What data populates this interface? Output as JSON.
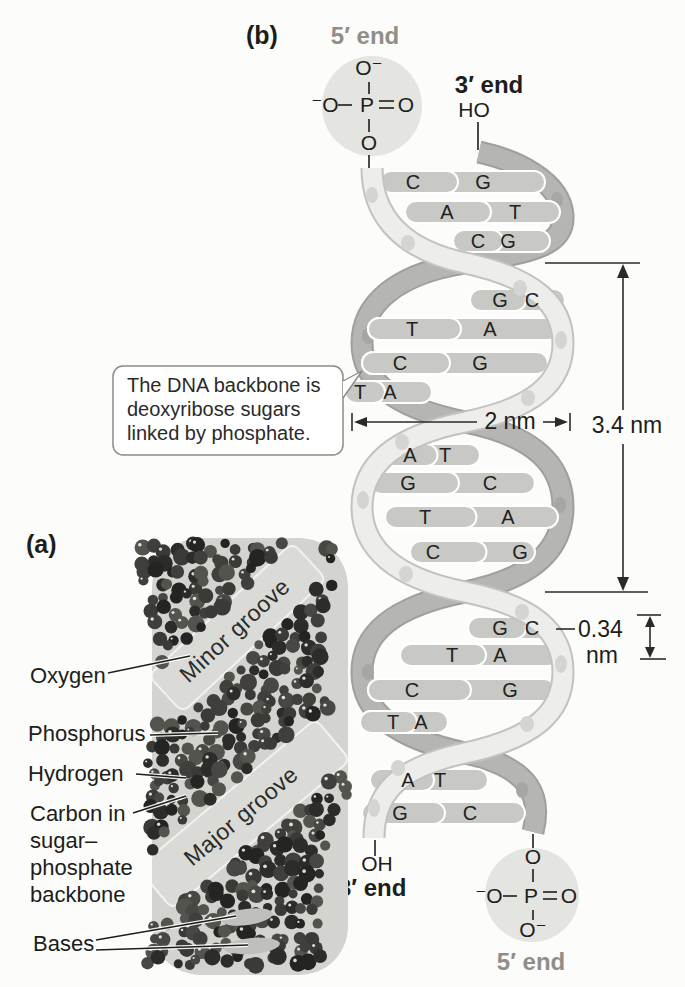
{
  "figure_labels": {
    "panel_a": "(a)",
    "panel_b": "(b)"
  },
  "strand_ends": {
    "top_five_prime": "5′ end",
    "top_three_prime": "3′ end",
    "top_ho": "HO",
    "bottom_oh": "OH",
    "bottom_three_prime": "3′ end",
    "bottom_five_prime": "5′ end"
  },
  "phosphate_top": {
    "o_top": "O⁻",
    "o_left": "⁻O",
    "p": "P",
    "o_right": "O",
    "o_bottom": "O"
  },
  "phosphate_bottom": {
    "o_top": "O",
    "o_left": "⁻O",
    "p": "P",
    "o_right": "O",
    "o_bottom": "O⁻"
  },
  "callout": {
    "line1": "The DNA backbone is",
    "line2": "deoxyribose sugars",
    "line3": "linked by phosphate."
  },
  "measurements": {
    "diameter": "2 nm",
    "turn_length": "3.4 nm",
    "base_spacing_value": "0.34",
    "base_spacing_unit": "nm"
  },
  "base_pairs": [
    {
      "l": "C",
      "r": "G"
    },
    {
      "l": "A",
      "r": "T"
    },
    {
      "l": "C",
      "r": "G"
    },
    {
      "l": "G",
      "r": "C"
    },
    {
      "l": "T",
      "r": "A"
    },
    {
      "l": "C",
      "r": "G"
    },
    {
      "l": "T",
      "r": "A"
    },
    {
      "l": "A",
      "r": "T"
    },
    {
      "l": "G",
      "r": "C"
    },
    {
      "l": "T",
      "r": "A"
    },
    {
      "l": "C",
      "r": "G"
    },
    {
      "l": "G",
      "r": "C"
    },
    {
      "l": "T",
      "r": "A"
    },
    {
      "l": "C",
      "r": "G"
    },
    {
      "l": "T",
      "r": "A"
    },
    {
      "l": "A",
      "r": "T"
    },
    {
      "l": "G",
      "r": "C"
    }
  ],
  "model_labels": {
    "oxygen": "Oxygen",
    "phosphorus": "Phosphorus",
    "hydrogen": "Hydrogen",
    "carbon_line1": "Carbon in",
    "carbon_line2": "sugar–",
    "carbon_line3": "phosphate",
    "carbon_line4": "backbone",
    "bases": "Bases",
    "minor_groove": "Minor groove",
    "major_groove": "Major groove"
  },
  "colors": {
    "five_prime_label": "#918e87",
    "ink": "#1d1d1b",
    "light_strand": "#ececea",
    "dark_strand": "#b5b5b2",
    "base_bar": "#c8c8c4",
    "phosphate_circle": "#e4e4e1"
  }
}
